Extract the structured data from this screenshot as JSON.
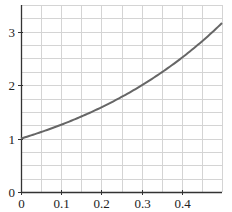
{
  "chart_data": {
    "type": "line",
    "title": "",
    "xlabel": "",
    "ylabel": "",
    "xlim": [
      0,
      0.5
    ],
    "ylim": [
      0,
      3.5
    ],
    "grid": true,
    "grid_minor": {
      "x_step": 0.05,
      "y_step": 0.25
    },
    "x_ticks": [
      0,
      0.1,
      0.2,
      0.3,
      0.4
    ],
    "x_tick_labels": [
      "0",
      "0.1",
      "0.2",
      "0.3",
      "0.4"
    ],
    "y_ticks": [
      0,
      1,
      2,
      3
    ],
    "y_tick_labels": [
      "0",
      "1",
      "2",
      "3"
    ],
    "legend": null,
    "series": [
      {
        "name": "y = 10^x",
        "color": "#666666",
        "x": [
          0,
          0.05,
          0.1,
          0.15,
          0.2,
          0.25,
          0.3,
          0.35,
          0.4,
          0.45,
          0.5
        ],
        "y": [
          1.0,
          1.122,
          1.259,
          1.413,
          1.585,
          1.778,
          1.995,
          2.239,
          2.512,
          2.818,
          3.162
        ]
      }
    ]
  },
  "colors": {
    "axis": "#333333",
    "grid": "#d4d4d4",
    "curve": "#666666",
    "text": "#222222"
  }
}
